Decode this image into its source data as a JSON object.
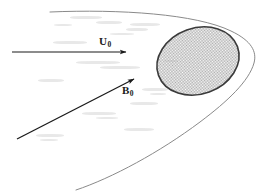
{
  "figure": {
    "background_color": "#ffffff",
    "width": 262,
    "height": 192,
    "labels": {
      "flow_velocity": {
        "symbol": "U",
        "subscript": "0",
        "color": "#1a1a1a"
      },
      "magnetic_field": {
        "symbol": "B",
        "subscript": "0",
        "color": "#1a1a1a"
      }
    },
    "obstacle": {
      "name": "hatched-ellipse",
      "fill_pattern": "checker-dither",
      "fill_color": "#c8c8c8",
      "stroke_color": "#3a3a3a",
      "center_x": 198,
      "center_y": 61,
      "radius_x": 42,
      "radius_y": 33,
      "rotation_deg": -20
    },
    "shock_curve": {
      "name": "bow-shock",
      "stroke_color": "#808080",
      "stroke_width": 1
    },
    "arrows": {
      "flow": {
        "name": "flow-arrow",
        "x1": 12,
        "y1": 52,
        "x2": 126,
        "y2": 52,
        "color": "#1a1a1a"
      },
      "field": {
        "name": "field-arrow",
        "x1": 17,
        "y1": 139,
        "x2": 134,
        "y2": 79,
        "color": "#1a1a1a"
      }
    }
  },
  "chart_data": {
    "type": "diagram",
    "annotations": [
      "U0",
      "B0"
    ],
    "elements": [
      {
        "kind": "vector",
        "label": "U0",
        "description": "uniform flow velocity, horizontal rightward"
      },
      {
        "kind": "vector",
        "label": "B0",
        "description": "ambient magnetic field, oblique up-right"
      },
      {
        "kind": "region",
        "label": "obstacle",
        "description": "shaded ellipse"
      },
      {
        "kind": "curve",
        "label": "shock",
        "description": "parabolic bow shock opening to the left"
      }
    ]
  },
  "smudges": [
    {
      "x": 70,
      "y": 16,
      "w": 32,
      "h": 3
    },
    {
      "x": 96,
      "y": 21,
      "w": 26,
      "h": 3
    },
    {
      "x": 130,
      "y": 23,
      "w": 30,
      "h": 3
    },
    {
      "x": 126,
      "y": 28,
      "w": 22,
      "h": 3
    },
    {
      "x": 53,
      "y": 41,
      "w": 34,
      "h": 3
    },
    {
      "x": 110,
      "y": 33,
      "w": 24,
      "h": 2
    },
    {
      "x": 76,
      "y": 61,
      "w": 44,
      "h": 3
    },
    {
      "x": 100,
      "y": 66,
      "w": 40,
      "h": 3
    },
    {
      "x": 38,
      "y": 79,
      "w": 26,
      "h": 3
    },
    {
      "x": 142,
      "y": 88,
      "w": 26,
      "h": 3
    },
    {
      "x": 150,
      "y": 93,
      "w": 16,
      "h": 2
    },
    {
      "x": 130,
      "y": 102,
      "w": 28,
      "h": 3
    },
    {
      "x": 82,
      "y": 112,
      "w": 34,
      "h": 3
    },
    {
      "x": 96,
      "y": 117,
      "w": 22,
      "h": 2
    },
    {
      "x": 124,
      "y": 128,
      "w": 30,
      "h": 3
    },
    {
      "x": 36,
      "y": 134,
      "w": 28,
      "h": 3
    },
    {
      "x": 40,
      "y": 139,
      "w": 18,
      "h": 2
    },
    {
      "x": 164,
      "y": 60,
      "w": 14,
      "h": 2
    },
    {
      "x": 54,
      "y": 24,
      "w": 18,
      "h": 2
    }
  ]
}
